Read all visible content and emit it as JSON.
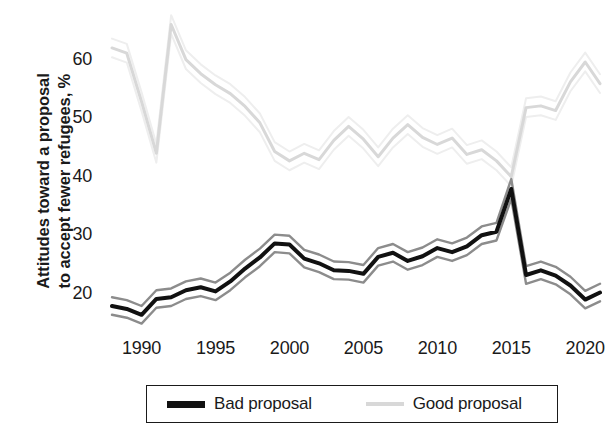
{
  "chart_data": {
    "type": "line",
    "title": "",
    "subtitle": "",
    "xlabel": "",
    "ylabel": "Attitudes toward a proposal\nto accept fewer refugees, %",
    "xlim": [
      1988,
      2021
    ],
    "ylim": [
      14,
      68
    ],
    "xticks": [
      1990,
      1995,
      2000,
      2005,
      2010,
      2015,
      2020
    ],
    "yticks": [
      20,
      30,
      40,
      50,
      60
    ],
    "grid": false,
    "legend_position": "bottom",
    "legend_entries": [
      "Bad proposal",
      "Good proposal"
    ],
    "colors": {
      "bad_proposal": "#111111",
      "good_proposal": "#d8d8d8",
      "bad_proposal_band": "#8c8c8c",
      "good_proposal_band": "#eeeeee",
      "text": "#1a1a1a",
      "background": "#ffffff"
    },
    "x": [
      1988,
      1989,
      1990,
      1991,
      1992,
      1993,
      1994,
      1995,
      1996,
      1997,
      1998,
      1999,
      2000,
      2001,
      2002,
      2003,
      2004,
      2005,
      2006,
      2007,
      2008,
      2009,
      2010,
      2011,
      2012,
      2013,
      2014,
      2015,
      2016,
      2017,
      2018,
      2019,
      2020,
      2021
    ],
    "series": [
      {
        "name": "Bad proposal",
        "color": "#111111",
        "values": [
          18.1,
          17.6,
          16.6,
          19.3,
          19.6,
          20.8,
          21.3,
          20.6,
          22.3,
          24.5,
          26.4,
          28.8,
          28.6,
          26.2,
          25.4,
          24.2,
          24.1,
          23.6,
          26.5,
          27.2,
          25.8,
          26.6,
          28.0,
          27.3,
          28.3,
          30.2,
          30.8,
          38.1,
          23.4,
          24.2,
          23.3,
          21.6,
          19.2,
          20.4
        ],
        "band_lower": [
          16.6,
          16.1,
          15.1,
          17.8,
          18.1,
          19.3,
          19.8,
          19.1,
          20.8,
          23.0,
          24.9,
          27.3,
          27.1,
          24.7,
          23.9,
          22.7,
          22.6,
          22.1,
          25.0,
          25.7,
          24.3,
          25.1,
          26.5,
          25.8,
          26.8,
          28.7,
          29.3,
          36.4,
          21.9,
          22.7,
          21.8,
          20.1,
          17.7,
          18.9
        ],
        "band_upper": [
          19.6,
          19.1,
          18.1,
          20.8,
          21.1,
          22.3,
          22.8,
          22.1,
          23.8,
          26.0,
          27.9,
          30.3,
          30.1,
          27.7,
          26.9,
          25.7,
          25.6,
          25.1,
          28.0,
          28.7,
          27.3,
          28.1,
          29.5,
          28.8,
          29.8,
          31.7,
          32.3,
          39.8,
          24.9,
          25.7,
          24.8,
          23.1,
          20.7,
          21.9
        ]
      },
      {
        "name": "Good proposal",
        "color": "#d8d8d8",
        "values": [
          62.2,
          61.3,
          53.0,
          44.2,
          66.2,
          60.2,
          57.8,
          55.9,
          54.4,
          52.2,
          49.4,
          44.5,
          42.9,
          44.2,
          43.1,
          46.4,
          48.8,
          46.6,
          43.6,
          46.8,
          49.1,
          46.9,
          45.7,
          46.8,
          44.0,
          44.8,
          42.9,
          40.2,
          52.0,
          52.3,
          51.5,
          56.4,
          59.8,
          56.1
        ],
        "band_lower": [
          60.6,
          59.7,
          51.4,
          42.6,
          64.6,
          58.6,
          56.2,
          54.3,
          52.8,
          50.6,
          47.8,
          42.9,
          41.3,
          42.6,
          41.5,
          44.8,
          47.2,
          45.0,
          42.0,
          45.2,
          47.5,
          45.3,
          44.1,
          45.2,
          42.4,
          43.2,
          41.3,
          38.6,
          50.4,
          50.7,
          49.9,
          54.8,
          58.2,
          54.5
        ],
        "band_upper": [
          63.8,
          62.9,
          54.6,
          45.8,
          67.8,
          61.8,
          59.4,
          57.5,
          56.0,
          53.8,
          51.0,
          46.1,
          44.5,
          45.8,
          44.7,
          48.0,
          50.4,
          48.2,
          45.2,
          48.4,
          50.7,
          48.5,
          47.3,
          48.4,
          45.6,
          46.4,
          44.5,
          41.8,
          53.6,
          53.9,
          53.1,
          58.0,
          61.4,
          57.7
        ]
      }
    ]
  },
  "axis": {
    "y_title": "Attitudes toward a proposal\nto accept fewer refugees, %",
    "y_ticks": [
      "60",
      "50",
      "40",
      "30",
      "20"
    ],
    "x_ticks": [
      "1990",
      "1995",
      "2000",
      "2005",
      "2010",
      "2015",
      "2020"
    ]
  },
  "legend": {
    "bad_label": "Bad proposal",
    "good_label": "Good proposal"
  }
}
